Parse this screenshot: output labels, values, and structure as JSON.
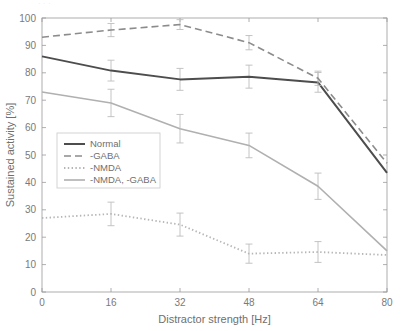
{
  "figure": {
    "top_caption_remnant": "· · ·",
    "background_color": "#ffffff"
  },
  "chart_data": {
    "type": "line",
    "title": "",
    "xlabel": "Distractor strength [Hz]",
    "ylabel": "Sustained activity [%]",
    "x": [
      0,
      16,
      32,
      48,
      64,
      80
    ],
    "xlim": [
      0,
      80
    ],
    "ylim": [
      0,
      100
    ],
    "xticks": [
      0,
      16,
      32,
      48,
      64,
      80
    ],
    "yticks": [
      0,
      10,
      20,
      30,
      40,
      50,
      60,
      70,
      80,
      90,
      100
    ],
    "xtick_labels": [
      "0",
      "16",
      "32",
      "48",
      "64",
      "80"
    ],
    "ytick_labels": [
      "0",
      "10",
      "20",
      "30",
      "40",
      "50",
      "60",
      "70",
      "80",
      "90",
      "100"
    ],
    "grid": false,
    "legend_position": "lower-left-inside",
    "error_bars": true,
    "series": [
      {
        "name": "Normal",
        "style": "solid",
        "color": "#4d4d4d",
        "width": 2.0,
        "values": [
          86,
          80.8,
          77.6,
          78.6,
          76.5,
          43.5
        ],
        "errors": [
          0,
          3.8,
          4.0,
          4.2,
          3.6,
          0
        ]
      },
      {
        "name": "-GABA",
        "style": "dashed",
        "color": "#8c8c8c",
        "width": 1.6,
        "values": [
          93,
          95.6,
          97.6,
          91,
          78,
          47
        ],
        "errors": [
          0,
          2.4,
          1.8,
          2.6,
          2.6,
          0
        ]
      },
      {
        "name": "-NMDA",
        "style": "dotted",
        "color": "#b5b5b5",
        "width": 1.8,
        "values": [
          27,
          28.5,
          24.6,
          14,
          14.6,
          13.5
        ],
        "errors": [
          0,
          4.3,
          4.2,
          3.5,
          3.8,
          0
        ]
      },
      {
        "name": "-NMDA, -GABA",
        "style": "solid",
        "color": "#b0b0b0",
        "width": 1.6,
        "values": [
          73,
          69,
          59.6,
          53.5,
          38.6,
          15
        ],
        "errors": [
          0,
          5.0,
          5.2,
          4.5,
          4.8,
          0
        ]
      }
    ]
  },
  "legend": {
    "entries": [
      {
        "label": "Normal"
      },
      {
        "label": "-GABA"
      },
      {
        "label": "-NMDA"
      },
      {
        "label": "-NMDA, -GABA"
      }
    ]
  }
}
